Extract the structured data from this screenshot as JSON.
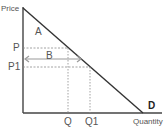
{
  "diagram": {
    "type": "demand-curve",
    "axes": {
      "y_label": "Price",
      "x_label": "Quantity"
    },
    "price_levels": [
      {
        "label": "P"
      },
      {
        "label": "P1"
      }
    ],
    "quantity_levels": [
      {
        "label": "Q"
      },
      {
        "label": "Q1"
      }
    ],
    "regions": {
      "a": "A",
      "b": "B"
    },
    "curve_label": "D",
    "colors": {
      "axis": "#444444",
      "curve": "#333333",
      "guides": "#8a8a8a",
      "arrow": "#9a9a9a",
      "text": "#555555"
    }
  }
}
